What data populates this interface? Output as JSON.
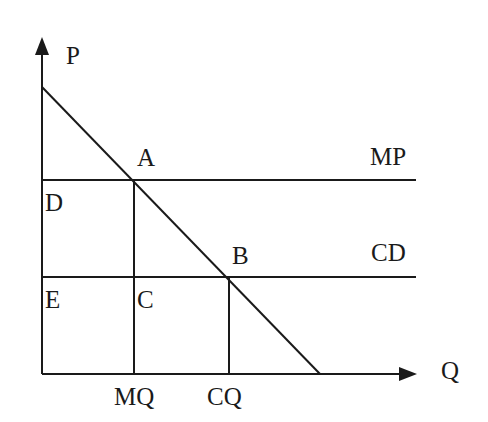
{
  "diagram": {
    "type": "monopoly-vs-competition-price-quantity",
    "axes": {
      "y_label": "P",
      "x_label": "Q"
    },
    "curves": {
      "demand": "downward-sloping demand line",
      "monopoly_price_line": "MP",
      "competitive_line": "CD"
    },
    "points": {
      "A": "A",
      "B": "B",
      "C": "C",
      "D": "D",
      "E": "E"
    },
    "ticks": {
      "monopoly_quantity": "MQ",
      "competitive_quantity": "CQ"
    },
    "colors": {
      "line": "#1a1a1a",
      "background": "#ffffff"
    }
  }
}
